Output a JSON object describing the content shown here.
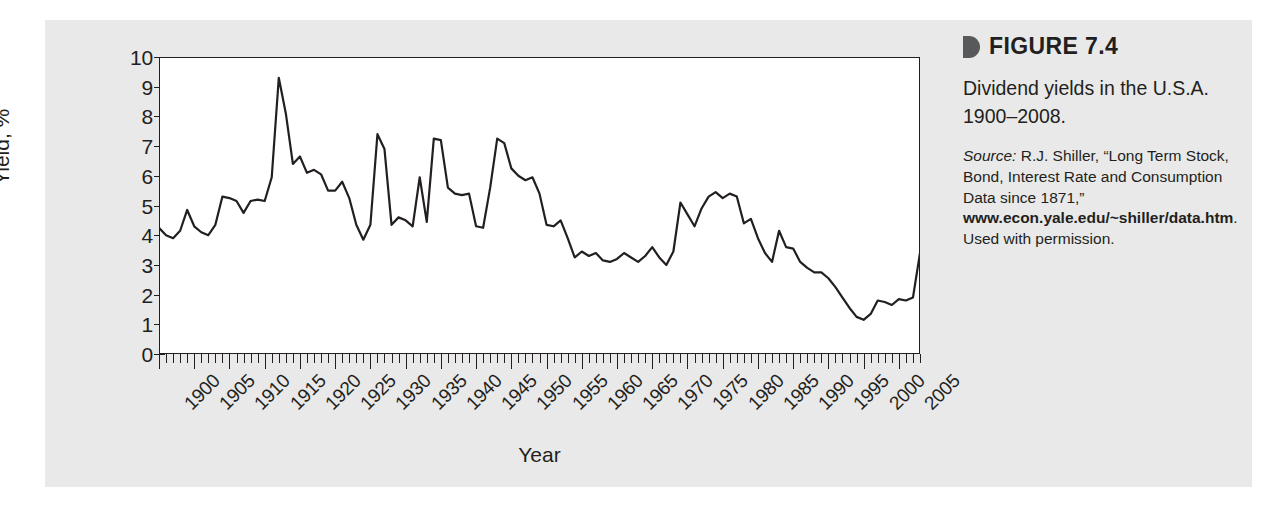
{
  "figure": {
    "marker_icon": "triangle-right-icon",
    "number_label": "FIGURE 7.4",
    "description": "Dividend yields in the U.S.A. 1900–2008.",
    "source_word": "Source:",
    "source_text_1": " R.J. Shiller, “Long Term Stock, Bond, Interest Rate and Consumption Data since 1871,” ",
    "source_url": "www.econ.yale.edu/~shiller/data.htm",
    "source_text_2": ". Used with permission."
  },
  "chart_data": {
    "type": "line",
    "title": "Dividend yields in the U.S.A. 1900–2008.",
    "xlabel": "Year",
    "ylabel": "Yield, %",
    "xlim": [
      1900,
      2008
    ],
    "ylim": [
      0,
      10
    ],
    "grid": false,
    "legend": null,
    "line_color": "#231f20",
    "y_ticks": [
      0,
      1,
      2,
      3,
      4,
      5,
      6,
      7,
      8,
      9,
      10
    ],
    "y_tick_labels": [
      "0",
      "1",
      "2",
      "3",
      "4",
      "5",
      "6",
      "7",
      "8",
      "9",
      "10"
    ],
    "x_major_ticks": [
      1900,
      1905,
      1910,
      1915,
      1920,
      1925,
      1930,
      1935,
      1940,
      1945,
      1950,
      1955,
      1960,
      1965,
      1970,
      1975,
      1980,
      1985,
      1990,
      1995,
      2000,
      2005
    ],
    "x_tick_labels": [
      "1900",
      "1905",
      "1910",
      "1915",
      "1920",
      "1925",
      "1930",
      "1935",
      "1940",
      "1945",
      "1950",
      "1955",
      "1960",
      "1965",
      "1970",
      "1975",
      "1980",
      "1985",
      "1990",
      "1995",
      "2000",
      "2005"
    ],
    "x_minor_tick_step": 1,
    "x": [
      1900,
      1901,
      1902,
      1903,
      1904,
      1905,
      1906,
      1907,
      1908,
      1909,
      1910,
      1911,
      1912,
      1913,
      1914,
      1915,
      1916,
      1917,
      1918,
      1919,
      1920,
      1921,
      1922,
      1923,
      1924,
      1925,
      1926,
      1927,
      1928,
      1929,
      1930,
      1931,
      1932,
      1933,
      1934,
      1935,
      1936,
      1937,
      1938,
      1939,
      1940,
      1941,
      1942,
      1943,
      1944,
      1945,
      1946,
      1947,
      1948,
      1949,
      1950,
      1951,
      1952,
      1953,
      1954,
      1955,
      1956,
      1957,
      1958,
      1959,
      1960,
      1961,
      1962,
      1963,
      1964,
      1965,
      1966,
      1967,
      1968,
      1969,
      1970,
      1971,
      1972,
      1973,
      1974,
      1975,
      1976,
      1977,
      1978,
      1979,
      1980,
      1981,
      1982,
      1983,
      1984,
      1985,
      1986,
      1987,
      1988,
      1989,
      1990,
      1991,
      1992,
      1993,
      1994,
      1995,
      1996,
      1997,
      1998,
      1999,
      2000,
      2001,
      2002,
      2003,
      2004,
      2005,
      2006,
      2007,
      2008
    ],
    "y": [
      4.25,
      4.0,
      3.9,
      4.15,
      4.85,
      4.3,
      4.1,
      4.0,
      4.35,
      5.3,
      5.25,
      5.15,
      4.75,
      5.15,
      5.2,
      5.15,
      5.95,
      9.3,
      8.1,
      6.4,
      6.65,
      6.1,
      6.2,
      6.05,
      5.5,
      5.5,
      5.8,
      5.25,
      4.35,
      3.85,
      4.35,
      7.4,
      6.9,
      4.35,
      4.6,
      4.5,
      4.3,
      5.95,
      4.45,
      7.25,
      7.2,
      5.6,
      5.4,
      5.35,
      5.4,
      4.3,
      4.25,
      5.6,
      7.25,
      7.1,
      6.25,
      6.0,
      5.85,
      5.95,
      5.4,
      4.35,
      4.3,
      4.5,
      3.9,
      3.25,
      3.45,
      3.3,
      3.4,
      3.15,
      3.1,
      3.2,
      3.4,
      3.25,
      3.1,
      3.3,
      3.6,
      3.25,
      3.0,
      3.45,
      5.1,
      4.7,
      4.3,
      4.9,
      5.3,
      5.45,
      5.25,
      5.4,
      5.3,
      4.4,
      4.55,
      3.9,
      3.4,
      3.1,
      4.15,
      3.6,
      3.55,
      3.1,
      2.9,
      2.75,
      2.75,
      2.55,
      2.25,
      1.9,
      1.55,
      1.25,
      1.15,
      1.35,
      1.8,
      1.75,
      1.65,
      1.85,
      1.8,
      1.9,
      3.4
    ]
  }
}
